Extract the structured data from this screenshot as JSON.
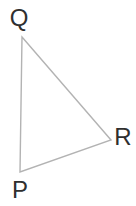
{
  "figure": {
    "type": "triangle",
    "background": "#ffffff",
    "stroke_color": "#b3b3b3",
    "stroke_width": 1.4,
    "label_color": "#2f2f2f",
    "vertices": [
      {
        "label": "Q",
        "x": 22,
        "y": 37,
        "label_x": 19,
        "label_y": 18
      },
      {
        "label": "R",
        "x": 111,
        "y": 140,
        "label_x": 123,
        "label_y": 137
      },
      {
        "label": "P",
        "x": 20,
        "y": 172,
        "label_x": 20,
        "label_y": 190
      }
    ]
  }
}
